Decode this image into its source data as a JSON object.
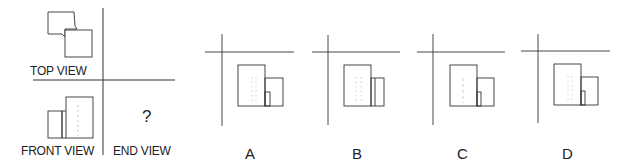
{
  "problem": {
    "views": {
      "top_view_label": "TOP VIEW",
      "front_view_label": "FRONT VIEW",
      "end_view_label": "END VIEW",
      "end_view_unknown": "?"
    },
    "options": [
      {
        "label": "A"
      },
      {
        "label": "B"
      },
      {
        "label": "C"
      },
      {
        "label": "D"
      }
    ]
  },
  "colors": {
    "line": "#333333",
    "hidden_line": "#bbbbbb",
    "background": "#ffffff"
  }
}
